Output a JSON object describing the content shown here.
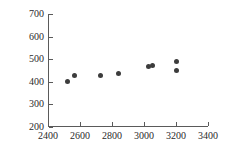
{
  "chart_data": {
    "type": "scatter",
    "title": "",
    "xlabel": "",
    "ylabel": "",
    "xlim": [
      2400,
      3400
    ],
    "ylim": [
      200,
      700
    ],
    "xticks": [
      2400,
      2600,
      2800,
      3000,
      3200,
      3400
    ],
    "yticks": [
      200,
      300,
      400,
      500,
      600,
      700
    ],
    "xtick_labels": [
      "2400",
      "2600",
      "2800",
      "3000",
      "3200",
      "3400"
    ],
    "ytick_labels": [
      "200",
      "300",
      "400",
      "500",
      "600",
      "700"
    ],
    "grid": false,
    "legend": null,
    "marker": "filled-circle",
    "marker_color": "#3c3c3c",
    "axis_color": "#5a5a5a",
    "background": "#ffffff",
    "points": [
      {
        "x": 2520,
        "y": 400
      },
      {
        "x": 2565,
        "y": 428
      },
      {
        "x": 2725,
        "y": 428
      },
      {
        "x": 2840,
        "y": 435
      },
      {
        "x": 3030,
        "y": 468
      },
      {
        "x": 3055,
        "y": 474
      },
      {
        "x": 3200,
        "y": 490
      },
      {
        "x": 3200,
        "y": 452
      }
    ]
  }
}
